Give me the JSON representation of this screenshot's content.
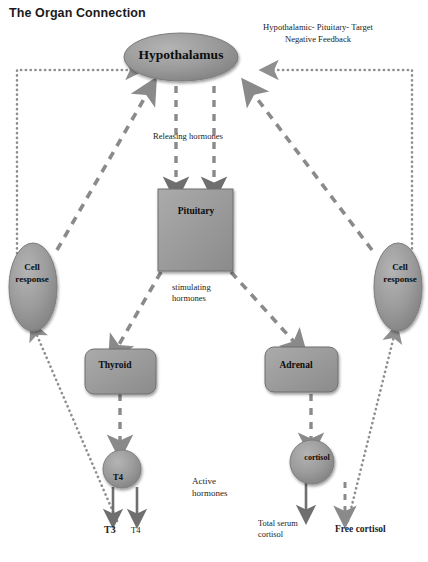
{
  "title": "The Organ Connection",
  "diagram": {
    "type": "flow-diagram",
    "nodes": [
      {
        "id": "hypothalamus",
        "label": "Hypothalamus",
        "shape": "ellipse"
      },
      {
        "id": "pituitary",
        "label": "Pituitary",
        "shape": "rectangle"
      },
      {
        "id": "thyroid",
        "label": "Thyroid",
        "shape": "rounded-rectangle"
      },
      {
        "id": "adrenal",
        "label": "Adrenal",
        "shape": "rounded-rectangle"
      },
      {
        "id": "t4",
        "label": "T4",
        "shape": "circle"
      },
      {
        "id": "cortisol",
        "label": "cortisol",
        "shape": "circle"
      },
      {
        "id": "cell-response-left",
        "label": "Cell\nresponse",
        "shape": "ellipse"
      },
      {
        "id": "cell-response-right",
        "label": "Cell\nresponse",
        "shape": "ellipse"
      }
    ],
    "annotations": {
      "feedback": "Hypothalamic- Pituitary- Target\nNegative Feedback",
      "releasing_hormones": "Releasing hormones",
      "stimulating_hormones": "stimulating\nhormones",
      "active_hormones": "Active\nhormones",
      "total_serum_cortisol": "Total serum\ncortisol",
      "free_cortisol": "Free cortisol",
      "t3_output": "T3",
      "t4_output": "T4"
    },
    "colors": {
      "node_fill": "#969696",
      "node_stroke": "#6e6e6e",
      "arrow_dashed": "#8a8a8a",
      "arrow_solid": "#6f6f6f",
      "arrow_dotted": "#8f8f8f",
      "text": "#111111",
      "background": "#ffffff"
    }
  }
}
